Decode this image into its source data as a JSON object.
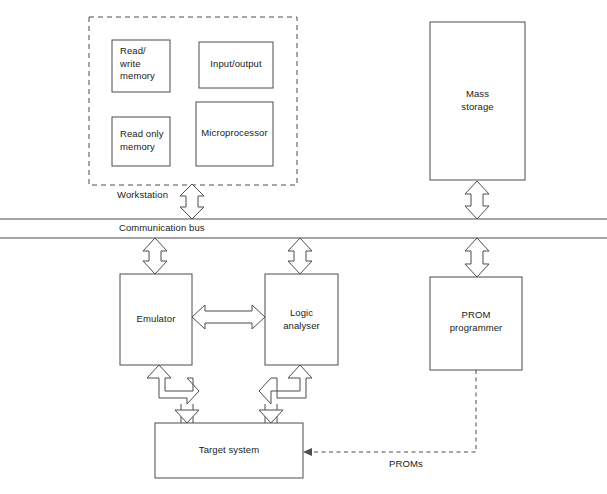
{
  "diagram": {
    "stroke_color": "#4d4d4d",
    "text_color": "#1a1a1a",
    "background": "#ffffff",
    "workstation_group": {
      "label": "Workstation",
      "border_style": "dashed",
      "boxes": [
        {
          "id": "read-write-memory",
          "label": "Read/\nwrite\nmemory",
          "align": "left"
        },
        {
          "id": "input-output",
          "label": "Input/output",
          "align": "center"
        },
        {
          "id": "read-only-memory",
          "label": "Read only\nmemory",
          "align": "left"
        },
        {
          "id": "microprocessor",
          "label": "Microprocessor",
          "align": "center"
        }
      ]
    },
    "boxes": [
      {
        "id": "mass-storage",
        "label": "Mass\nstorage",
        "align": "center"
      },
      {
        "id": "emulator",
        "label": "Emulator",
        "align": "center"
      },
      {
        "id": "logic-analyser",
        "label": "Logic\nanalyser",
        "align": "center"
      },
      {
        "id": "prom-programmer",
        "label": "PROM\nprogrammer",
        "align": "center"
      },
      {
        "id": "target-system",
        "label": "Target system",
        "align": "center"
      }
    ],
    "bus": {
      "label": "Communication bus",
      "line_count": 2
    },
    "connections": [
      {
        "id": "workstation-to-bus",
        "type": "double-arrow-vertical"
      },
      {
        "id": "mass-storage-to-bus",
        "type": "double-arrow-vertical"
      },
      {
        "id": "bus-to-emulator",
        "type": "double-arrow-vertical"
      },
      {
        "id": "bus-to-logic-analyser",
        "type": "double-arrow-vertical"
      },
      {
        "id": "bus-to-prom-programmer",
        "type": "double-arrow-vertical"
      },
      {
        "id": "emulator-to-logic-analyser",
        "type": "double-arrow-horizontal"
      },
      {
        "id": "emulator-to-target-system",
        "type": "elbow-double-arrow"
      },
      {
        "id": "logic-analyser-to-target-system",
        "type": "elbow-double-arrow"
      },
      {
        "id": "prom-programmer-to-target-system",
        "type": "dashed-arrow",
        "label": "PROMs"
      }
    ]
  }
}
